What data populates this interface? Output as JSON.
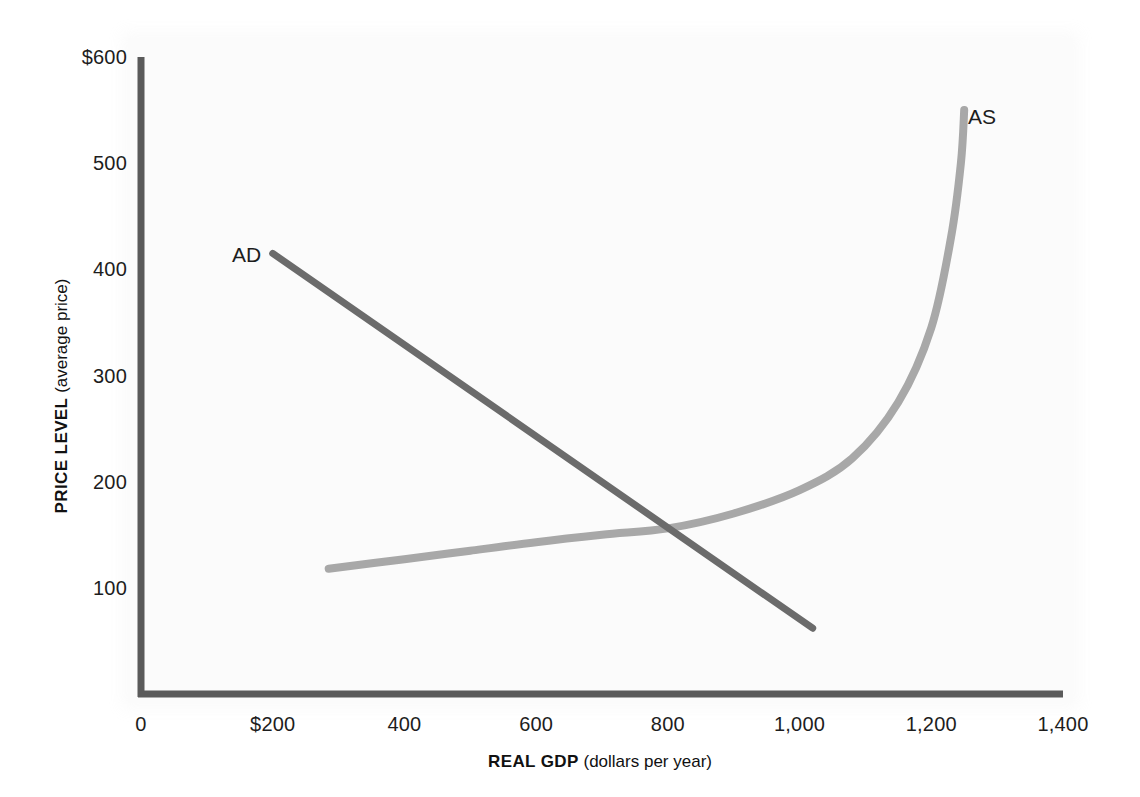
{
  "chart_data": {
    "type": "line",
    "title": "",
    "subtitle": "",
    "xlabel_bold": "REAL GDP",
    "xlabel_rest": " (dollars per year)",
    "ylabel_bold": "PRICE LEVEL",
    "ylabel_rest": " (average price)",
    "xlim": [
      0,
      1400
    ],
    "ylim": [
      0,
      600
    ],
    "grid": false,
    "legend_position": "inline-labels",
    "xticks": [
      0,
      200,
      400,
      600,
      800,
      1000,
      1200,
      1400
    ],
    "xtick_labels": [
      "0",
      "$200",
      "400",
      "600",
      "800",
      "1,000",
      "1,200",
      "1,400"
    ],
    "yticks": [
      100,
      200,
      300,
      400,
      500,
      600
    ],
    "ytick_labels": [
      "100",
      "200",
      "300",
      "400",
      "500",
      "$600"
    ],
    "series": [
      {
        "name": "AD",
        "label": "AD",
        "color": "#6b6b6b",
        "linewidth": 7,
        "shape": "straight downward-sloping line",
        "points": [
          {
            "x": 200,
            "y": 415
          },
          {
            "x": 1020,
            "y": 62
          }
        ]
      },
      {
        "name": "AS",
        "label": "AS",
        "color": "#a8a8a8",
        "linewidth": 8,
        "shape": "upward-sloping curve, flat at low GDP then near-vertical at full capacity",
        "points": [
          {
            "x": 285,
            "y": 118
          },
          {
            "x": 400,
            "y": 127
          },
          {
            "x": 500,
            "y": 135
          },
          {
            "x": 600,
            "y": 143
          },
          {
            "x": 700,
            "y": 150
          },
          {
            "x": 800,
            "y": 156
          },
          {
            "x": 900,
            "y": 170
          },
          {
            "x": 1000,
            "y": 192
          },
          {
            "x": 1080,
            "y": 222
          },
          {
            "x": 1150,
            "y": 275
          },
          {
            "x": 1200,
            "y": 345
          },
          {
            "x": 1230,
            "y": 430
          },
          {
            "x": 1245,
            "y": 500
          },
          {
            "x": 1250,
            "y": 550
          }
        ]
      }
    ],
    "annotations": [
      {
        "name": "equilibrium",
        "x": 805,
        "y": 157,
        "text": ""
      }
    ],
    "axis_color": "#5a5a5a"
  },
  "labels": {
    "ad": "AD",
    "as": "AS"
  }
}
